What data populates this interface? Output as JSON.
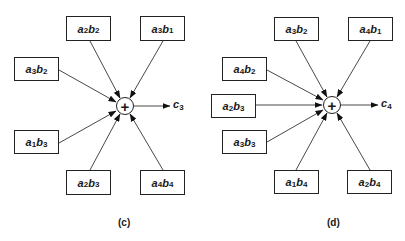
{
  "diagrams": [
    {
      "caption": "(c)",
      "output": {
        "var": "c",
        "sub": "3"
      },
      "operator": "+",
      "inputs": [
        {
          "a": "2",
          "b": "2"
        },
        {
          "a": "3",
          "b": "1"
        },
        {
          "a": "3",
          "b": "2"
        },
        {
          "a": "1",
          "b": "3"
        },
        {
          "a": "2",
          "b": "3"
        },
        {
          "a": "4",
          "b": "4"
        }
      ]
    },
    {
      "caption": "(d)",
      "output": {
        "var": "c",
        "sub": "4"
      },
      "operator": "+",
      "inputs": [
        {
          "a": "3",
          "b": "2"
        },
        {
          "a": "4",
          "b": "1"
        },
        {
          "a": "4",
          "b": "2"
        },
        {
          "a": "2",
          "b": "3"
        },
        {
          "a": "3",
          "b": "3"
        },
        {
          "a": "1",
          "b": "4"
        },
        {
          "a": "2",
          "b": "4"
        }
      ]
    }
  ],
  "labels": {
    "a": "a",
    "b": "b"
  }
}
